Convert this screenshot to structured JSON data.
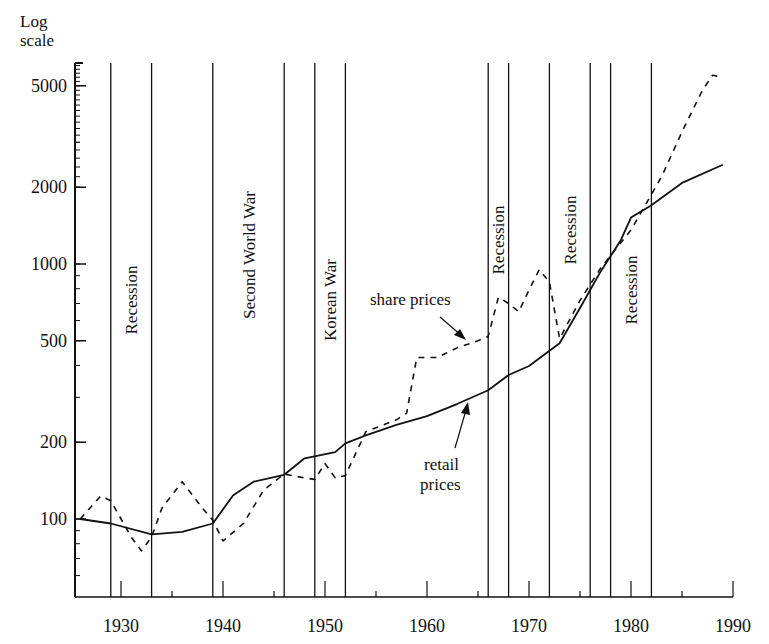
{
  "chart_data": {
    "type": "line",
    "title": "",
    "xlabel": "",
    "ylabel": "Log scale",
    "y_scale": "log",
    "xlim": [
      1925,
      1990
    ],
    "ylim": [
      55,
      6500
    ],
    "x_ticks": [
      1930,
      1940,
      1950,
      1960,
      1970,
      1980,
      1990
    ],
    "y_ticks": [
      100,
      200,
      500,
      1000,
      2000,
      5000
    ],
    "grid": false,
    "series": [
      {
        "name": "retail prices",
        "style": "solid",
        "x": [
          1926,
          1929,
          1933,
          1936,
          1939,
          1941,
          1943,
          1946,
          1948,
          1951,
          1952,
          1954,
          1957,
          1960,
          1963,
          1966,
          1968,
          1970,
          1973,
          1975,
          1977,
          1979,
          1980,
          1982,
          1985,
          1989
        ],
        "values": [
          100,
          96,
          87,
          89,
          96,
          124,
          140,
          149,
          173,
          183,
          198,
          213,
          234,
          253,
          283,
          320,
          367,
          398,
          489,
          672,
          931,
          1240,
          1520,
          1700,
          2080,
          2450
        ]
      },
      {
        "name": "share prices",
        "style": "dashed",
        "x": [
          1926,
          1928,
          1929,
          1931,
          1932,
          1933,
          1934,
          1936,
          1938,
          1939,
          1940,
          1942,
          1944,
          1946,
          1948,
          1949,
          1950,
          1951,
          1952,
          1954,
          1957,
          1958,
          1959,
          1961,
          1963,
          1965,
          1966,
          1967,
          1968,
          1969,
          1970,
          1971,
          1972,
          1973,
          1975,
          1977,
          1980,
          1983,
          1985,
          1987,
          1988,
          1989
        ],
        "values": [
          100,
          123,
          118,
          85,
          75,
          85,
          110,
          140,
          110,
          99,
          82,
          96,
          130,
          150,
          145,
          143,
          165,
          145,
          148,
          220,
          245,
          260,
          430,
          430,
          470,
          500,
          520,
          740,
          700,
          650,
          790,
          950,
          850,
          510,
          720,
          960,
          1360,
          2200,
          3300,
          4800,
          5500,
          5400
        ]
      }
    ],
    "event_periods": [
      {
        "label": "Recession",
        "start": 1929,
        "end": 1933
      },
      {
        "label": "Second World War",
        "start": 1939,
        "end": 1946
      },
      {
        "label": "Korean War",
        "start": 1949,
        "end": 1952
      },
      {
        "label": "Recession",
        "start": 1966,
        "end": 1968
      },
      {
        "label": "Recession",
        "start": 1972,
        "end": 1976
      },
      {
        "label": "Recession",
        "start": 1978,
        "end": 1982
      }
    ],
    "annotations": [
      {
        "text": "share prices",
        "points_to": "share prices",
        "near_x": 1964
      },
      {
        "text": "retail prices",
        "points_to": "retail prices",
        "near_x": 1962
      }
    ]
  },
  "labels": {
    "y_axis_title_line1": "Log",
    "y_axis_title_line2": "scale",
    "share_annotation": "share prices",
    "retail_annotation_line1": "retail",
    "retail_annotation_line2": "prices"
  }
}
